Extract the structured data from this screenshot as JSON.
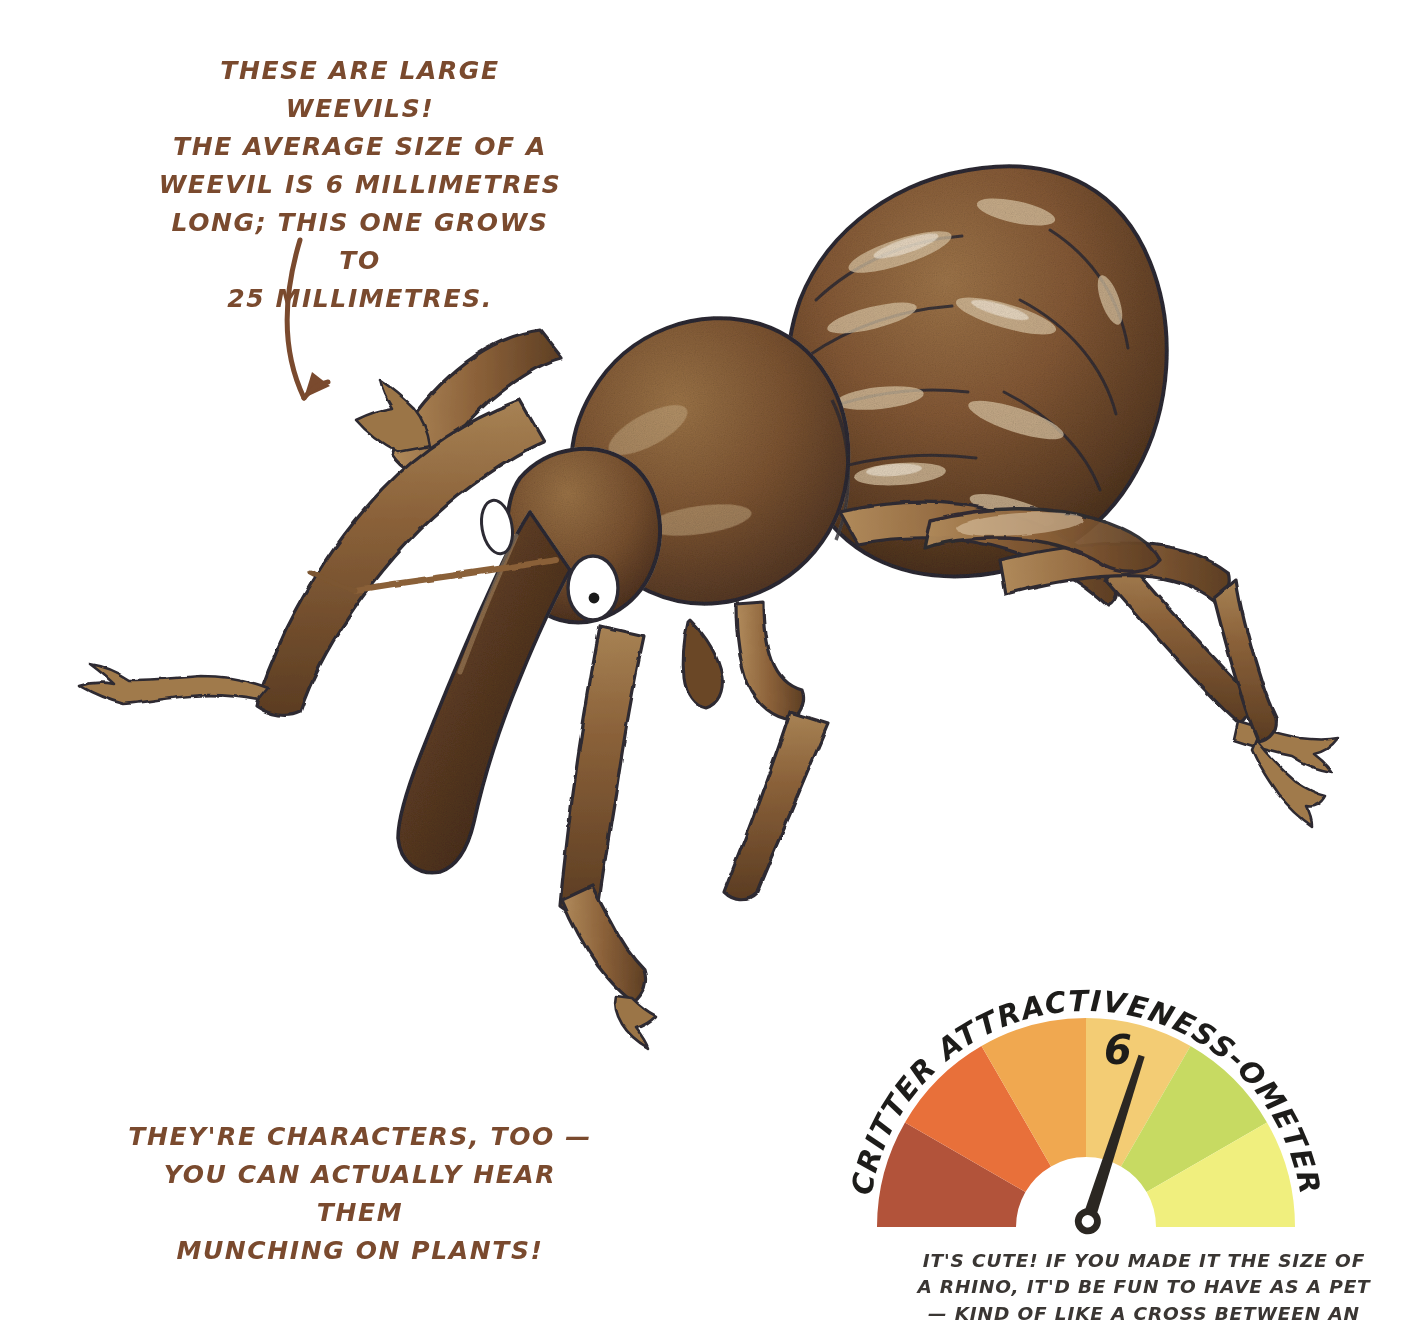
{
  "page": {
    "background_color": "#ffffff",
    "width": 1416,
    "height": 1321,
    "subject": "weevil"
  },
  "annotations": {
    "top_note": "THESE ARE LARGE WEEVILS!\nTHE AVERAGE SIZE OF A\nWEEVIL IS 6 MILLIMETRES\nLONG; THIS ONE GROWS TO\n25 MILLIMETRES.",
    "top_note_color": "#7a4a2e",
    "bottom_note": "THEY'RE CHARACTERS, TOO —\nYOU CAN ACTUALLY HEAR THEM\nMUNCHING ON PLANTS!",
    "bottom_note_color": "#7a4a2e",
    "pointer_arrow": "curved-arrow-icon"
  },
  "illustration": {
    "name": "weevil-illustration",
    "body_color": "#7d5433",
    "body_dark": "#4a3020",
    "body_light": "#b99a72",
    "outline_color": "#2c2a33",
    "eye_white": "#ffffff",
    "eye_pupil": "#1a1a1a",
    "parts": [
      "elytra",
      "pronotum",
      "head",
      "rostrum",
      "eye",
      "legs",
      "tarsi",
      "antenna"
    ]
  },
  "gauge": {
    "title": "CRITTER ATTRACTIVENESS-OMETER",
    "title_color": "#1d1c1a",
    "value": "6",
    "value_color": "#1d1c1a",
    "needle_color": "#2b2722",
    "min": 0,
    "max": 10,
    "segment_count": 6,
    "segments": [
      {
        "label": "lowest",
        "color": "#b2533a"
      },
      {
        "label": "low",
        "color": "#e8703a"
      },
      {
        "label": "mid-low",
        "color": "#f0a850"
      },
      {
        "label": "mid",
        "color": "#f3cc74"
      },
      {
        "label": "high",
        "color": "#c7da62"
      },
      {
        "label": "highest",
        "color": "#f0ef7e"
      }
    ],
    "caption": "IT'S CUTE! IF YOU MADE IT THE SIZE OF\nA RHINO, IT'D BE FUN TO HAVE AS A PET\n— KIND OF LIKE A CROSS BETWEEN AN",
    "caption_color": "#3a3633"
  },
  "chart_data": {
    "type": "pie",
    "title": "CRITTER ATTRACTIVENESS-OMETER",
    "subtype": "gauge",
    "value": 6,
    "min": 0,
    "max": 10,
    "categories": [
      "lowest",
      "low",
      "mid-low",
      "mid",
      "high",
      "highest"
    ],
    "values": [
      1,
      1,
      1,
      1,
      1,
      1
    ],
    "colors": [
      "#b2533a",
      "#e8703a",
      "#f0a850",
      "#f3cc74",
      "#c7da62",
      "#f0ef7e"
    ],
    "xlabel": "",
    "ylabel": "",
    "legend": "none",
    "annotations": [
      "6"
    ]
  }
}
